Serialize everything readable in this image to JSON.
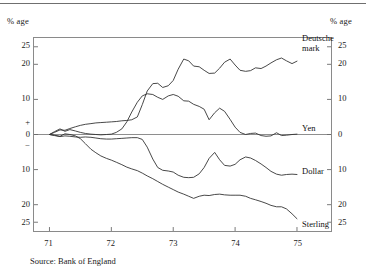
{
  "header": {
    "unit_left": "% age",
    "unit_right": "% age"
  },
  "source": "Source: Bank of England",
  "chart_data": {
    "type": "line",
    "title": "",
    "subtitle": "",
    "xlabel": "",
    "ylabel": "% age",
    "ylabel_right": "% age",
    "grid": false,
    "legend_position": "inline-right",
    "zero_line": true,
    "xlim": [
      70.75,
      75.55
    ],
    "ylim": [
      -27.5,
      27.5
    ],
    "x_ticks": [
      71,
      72,
      73,
      74,
      75
    ],
    "x_tick_labels": [
      "71",
      "72",
      "73",
      "74",
      "75"
    ],
    "y_ticks": [
      25,
      20,
      10,
      3.2,
      0,
      -3.2,
      -10,
      -20,
      -25
    ],
    "y_tick_labels_left": [
      "25",
      "20",
      "10",
      "+",
      "0",
      "−",
      "10",
      "20",
      "25"
    ],
    "y_tick_labels_right": [
      "25",
      "20",
      "10",
      "",
      "0",
      "",
      "10",
      "20",
      "25"
    ],
    "series": [
      {
        "name": "Deutsche mark",
        "color": "#333333",
        "x": [
          71.0,
          71.08,
          71.17,
          71.25,
          71.33,
          71.42,
          71.5,
          71.58,
          71.67,
          71.75,
          71.83,
          71.92,
          72.0,
          72.08,
          72.17,
          72.25,
          72.33,
          72.42,
          72.5,
          72.58,
          72.67,
          72.75,
          72.83,
          72.92,
          73.0,
          73.08,
          73.17,
          73.25,
          73.33,
          73.42,
          73.5,
          73.58,
          73.67,
          73.75,
          73.83,
          73.92,
          74.0,
          74.08,
          74.17,
          74.25,
          74.33,
          74.42,
          74.5,
          74.58,
          74.67,
          74.75,
          74.83,
          74.92,
          75.0
        ],
        "values": [
          0.0,
          0.6,
          1.3,
          1.2,
          1.7,
          2.2,
          2.6,
          2.9,
          3.1,
          3.3,
          3.4,
          3.5,
          3.6,
          3.7,
          3.9,
          4.0,
          4.2,
          5.0,
          8.5,
          12.4,
          14.5,
          14.6,
          13.4,
          13.9,
          15.4,
          18.6,
          21.5,
          21.0,
          19.5,
          19.3,
          18.3,
          17.4,
          17.5,
          18.9,
          20.6,
          21.5,
          19.8,
          18.3,
          18.0,
          18.2,
          19.0,
          18.8,
          19.5,
          20.4,
          21.3,
          21.8,
          21.0,
          20.2,
          20.9
        ]
      },
      {
        "name": "Yen",
        "color": "#333333",
        "x": [
          71.0,
          71.08,
          71.17,
          71.25,
          71.33,
          71.42,
          71.5,
          71.58,
          71.67,
          71.75,
          71.83,
          71.92,
          72.0,
          72.08,
          72.17,
          72.25,
          72.33,
          72.42,
          72.5,
          72.58,
          72.67,
          72.75,
          72.83,
          72.92,
          73.0,
          73.08,
          73.17,
          73.25,
          73.33,
          73.42,
          73.5,
          73.58,
          73.67,
          73.75,
          73.83,
          73.92,
          74.0,
          74.08,
          74.17,
          74.25,
          74.33,
          74.42,
          74.5,
          74.58,
          74.67,
          74.75,
          74.83,
          74.92,
          75.0
        ],
        "values": [
          0.0,
          0.8,
          1.6,
          0.9,
          1.4,
          1.0,
          0.6,
          0.3,
          0.1,
          0.0,
          -0.1,
          0.0,
          0.1,
          0.6,
          1.6,
          3.6,
          6.4,
          9.2,
          11.0,
          11.6,
          11.4,
          10.6,
          10.0,
          11.0,
          11.4,
          10.9,
          9.6,
          9.5,
          8.6,
          8.0,
          7.2,
          4.2,
          6.2,
          7.5,
          6.6,
          4.3,
          2.1,
          0.6,
          0.0,
          0.3,
          0.4,
          -0.3,
          -0.5,
          -0.4,
          0.5,
          -0.3,
          -0.2,
          0.0,
          0.1
        ]
      },
      {
        "name": "Dollar",
        "color": "#333333",
        "x": [
          71.0,
          71.08,
          71.17,
          71.25,
          71.33,
          71.42,
          71.5,
          71.58,
          71.67,
          71.75,
          71.83,
          71.92,
          72.0,
          72.08,
          72.17,
          72.25,
          72.33,
          72.42,
          72.5,
          72.58,
          72.67,
          72.75,
          72.83,
          72.92,
          73.0,
          73.08,
          73.17,
          73.25,
          73.33,
          73.42,
          73.5,
          73.58,
          73.67,
          73.75,
          73.83,
          73.92,
          74.0,
          74.08,
          74.17,
          74.25,
          74.33,
          74.42,
          74.5,
          74.58,
          74.67,
          74.75,
          74.83,
          74.92,
          75.0
        ],
        "values": [
          0.0,
          -0.3,
          -0.6,
          -0.4,
          -0.5,
          -0.7,
          -0.8,
          -0.7,
          -0.8,
          -1.0,
          -1.2,
          -1.3,
          -1.3,
          -1.2,
          -1.1,
          -1.0,
          -0.9,
          -0.9,
          -1.4,
          -3.6,
          -7.0,
          -9.4,
          -10.2,
          -10.4,
          -10.7,
          -11.6,
          -12.2,
          -12.3,
          -12.2,
          -11.2,
          -9.4,
          -6.8,
          -5.1,
          -7.2,
          -8.8,
          -9.0,
          -8.5,
          -7.2,
          -6.4,
          -6.7,
          -7.4,
          -8.4,
          -9.4,
          -10.5,
          -11.3,
          -11.6,
          -11.4,
          -11.3,
          -11.4
        ]
      },
      {
        "name": "Sterling",
        "color": "#333333",
        "x": [
          71.0,
          71.08,
          71.17,
          71.25,
          71.33,
          71.42,
          71.5,
          71.58,
          71.67,
          71.75,
          71.83,
          71.92,
          72.0,
          72.08,
          72.17,
          72.25,
          72.33,
          72.42,
          72.5,
          72.58,
          72.67,
          72.75,
          72.83,
          72.92,
          73.0,
          73.08,
          73.17,
          73.25,
          73.33,
          73.42,
          73.5,
          73.58,
          73.67,
          73.75,
          73.83,
          73.92,
          74.0,
          74.08,
          74.17,
          74.25,
          74.33,
          74.42,
          74.5,
          74.58,
          74.67,
          74.75,
          74.83,
          74.92,
          75.0
        ],
        "values": [
          0.0,
          -0.2,
          -0.5,
          0.2,
          0.0,
          -0.4,
          -1.2,
          -2.6,
          -4.2,
          -5.2,
          -6.1,
          -6.8,
          -7.3,
          -7.9,
          -8.6,
          -9.3,
          -9.8,
          -10.3,
          -11.0,
          -11.8,
          -12.6,
          -13.4,
          -14.2,
          -15.0,
          -15.7,
          -16.4,
          -17.0,
          -17.6,
          -18.2,
          -17.6,
          -17.3,
          -17.4,
          -17.1,
          -17.0,
          -17.2,
          -17.3,
          -17.3,
          -17.3,
          -17.6,
          -18.2,
          -18.6,
          -19.1,
          -19.6,
          -20.2,
          -20.6,
          -20.6,
          -21.2,
          -22.6,
          -24.0
        ]
      }
    ],
    "annotations": [
      {
        "text": "Deutsche\nmark",
        "series": "Deutsche mark"
      },
      {
        "text": "Yen",
        "series": "Yen"
      },
      {
        "text": "Dollar",
        "series": "Dollar"
      },
      {
        "text": "Sterling",
        "series": "Sterling"
      }
    ]
  }
}
